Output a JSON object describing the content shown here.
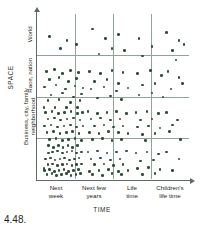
{
  "caption": "4.48.",
  "axes": {
    "y_title": "SPACE",
    "x_title": "TIME",
    "y_bands": [
      {
        "label": "neighborhood"
      },
      {
        "label": "Business, city, family"
      },
      {
        "label": "Race, nation"
      },
      {
        "label": "World"
      }
    ],
    "x_ticks": [
      {
        "line1": "Next",
        "line2": "week"
      },
      {
        "line1": "Next few",
        "line2": "years"
      },
      {
        "line1": "Life",
        "line2": "time"
      },
      {
        "line1": "Children's",
        "line2": "life time"
      }
    ]
  },
  "colors": {
    "dot": "#2f4f3a",
    "gridline": "#8fa398",
    "axis": "#5d6b63",
    "text": "#231f20",
    "background": "#ffffff"
  },
  "chart_data": {
    "type": "scatter",
    "title": "",
    "subtitle": "",
    "xlabel": "TIME",
    "ylabel": "SPACE",
    "grid": true,
    "legend": "none",
    "x_categories": [
      "Next week",
      "Next few years",
      "Life time",
      "Children's life time"
    ],
    "y_categories": [
      "neighborhood",
      "Business, city, family",
      "Race, nation",
      "World"
    ],
    "xlim": [
      0,
      4
    ],
    "ylim": [
      0,
      4
    ],
    "cell_counts": [
      {
        "x": "Next week",
        "y": "neighborhood",
        "count": 48
      },
      {
        "x": "Next few years",
        "y": "neighborhood",
        "count": 22
      },
      {
        "x": "Life time",
        "y": "neighborhood",
        "count": 7
      },
      {
        "x": "Children's life time",
        "y": "neighborhood",
        "count": 3
      },
      {
        "x": "Next week",
        "y": "Business, city, family",
        "count": 40
      },
      {
        "x": "Next few years",
        "y": "Business, city, family",
        "count": 21
      },
      {
        "x": "Life time",
        "y": "Business, city, family",
        "count": 14
      },
      {
        "x": "Children's life time",
        "y": "Business, city, family",
        "count": 5
      },
      {
        "x": "Next week",
        "y": "Race, nation",
        "count": 22
      },
      {
        "x": "Next few years",
        "y": "Race, nation",
        "count": 14
      },
      {
        "x": "Life time",
        "y": "Race, nation",
        "count": 8
      },
      {
        "x": "Children's life time",
        "y": "Race, nation",
        "count": 4
      },
      {
        "x": "Next week",
        "y": "World",
        "count": 4
      },
      {
        "x": "Next few years",
        "y": "World",
        "count": 6
      },
      {
        "x": "Life time",
        "y": "World",
        "count": 3
      },
      {
        "x": "Children's life time",
        "y": "World",
        "count": 5
      }
    ],
    "points": [
      [
        13,
        142
      ],
      [
        18,
        141
      ],
      [
        24,
        140
      ],
      [
        30,
        142
      ],
      [
        36,
        141
      ],
      [
        42,
        140
      ],
      [
        48,
        142
      ],
      [
        54,
        141
      ],
      [
        9,
        148
      ],
      [
        15,
        147
      ],
      [
        21,
        149
      ],
      [
        27,
        148
      ],
      [
        33,
        147
      ],
      [
        39,
        149
      ],
      [
        45,
        148
      ],
      [
        51,
        147
      ],
      [
        12,
        154
      ],
      [
        18,
        153
      ],
      [
        24,
        155
      ],
      [
        30,
        154
      ],
      [
        36,
        153
      ],
      [
        42,
        155
      ],
      [
        48,
        154
      ],
      [
        54,
        153
      ],
      [
        8,
        160
      ],
      [
        14,
        159
      ],
      [
        20,
        161
      ],
      [
        26,
        160
      ],
      [
        32,
        159
      ],
      [
        38,
        161
      ],
      [
        44,
        160
      ],
      [
        50,
        159
      ],
      [
        11,
        164
      ],
      [
        17,
        163
      ],
      [
        23,
        165
      ],
      [
        29,
        164
      ],
      [
        35,
        163
      ],
      [
        41,
        165
      ],
      [
        47,
        164
      ],
      [
        53,
        163
      ],
      [
        7,
        158
      ],
      [
        13,
        134
      ],
      [
        25,
        134
      ],
      [
        37,
        134
      ],
      [
        49,
        134
      ],
      [
        19,
        136
      ],
      [
        31,
        136
      ],
      [
        43,
        136
      ],
      [
        62,
        141
      ],
      [
        74,
        140
      ],
      [
        86,
        142
      ],
      [
        98,
        141
      ],
      [
        110,
        140
      ],
      [
        66,
        148
      ],
      [
        78,
        147
      ],
      [
        90,
        149
      ],
      [
        102,
        148
      ],
      [
        70,
        154
      ],
      [
        82,
        153
      ],
      [
        94,
        155
      ],
      [
        106,
        154
      ],
      [
        64,
        161
      ],
      [
        76,
        160
      ],
      [
        88,
        159
      ],
      [
        100,
        161
      ],
      [
        112,
        160
      ],
      [
        68,
        164
      ],
      [
        80,
        165
      ],
      [
        92,
        163
      ],
      [
        104,
        164
      ],
      [
        122,
        142
      ],
      [
        136,
        141
      ],
      [
        150,
        143
      ],
      [
        128,
        150
      ],
      [
        144,
        149
      ],
      [
        124,
        158
      ],
      [
        138,
        157
      ],
      [
        152,
        159
      ],
      [
        130,
        164
      ],
      [
        146,
        163
      ],
      [
        160,
        141
      ],
      [
        176,
        148
      ],
      [
        168,
        160
      ],
      [
        9,
        100
      ],
      [
        17,
        99
      ],
      [
        25,
        101
      ],
      [
        33,
        100
      ],
      [
        41,
        99
      ],
      [
        49,
        101
      ],
      [
        55,
        100
      ],
      [
        12,
        107
      ],
      [
        20,
        106
      ],
      [
        28,
        108
      ],
      [
        36,
        107
      ],
      [
        44,
        106
      ],
      [
        52,
        108
      ],
      [
        8,
        114
      ],
      [
        16,
        113
      ],
      [
        24,
        115
      ],
      [
        32,
        114
      ],
      [
        40,
        113
      ],
      [
        48,
        115
      ],
      [
        56,
        114
      ],
      [
        11,
        121
      ],
      [
        19,
        120
      ],
      [
        27,
        122
      ],
      [
        35,
        121
      ],
      [
        43,
        120
      ],
      [
        51,
        122
      ],
      [
        14,
        128
      ],
      [
        22,
        127
      ],
      [
        30,
        129
      ],
      [
        38,
        128
      ],
      [
        46,
        127
      ],
      [
        54,
        129
      ],
      [
        7,
        95
      ],
      [
        21,
        95
      ],
      [
        35,
        95
      ],
      [
        49,
        95
      ],
      [
        62,
        99
      ],
      [
        74,
        101
      ],
      [
        86,
        100
      ],
      [
        98,
        99
      ],
      [
        110,
        101
      ],
      [
        66,
        107
      ],
      [
        78,
        106
      ],
      [
        90,
        108
      ],
      [
        102,
        107
      ],
      [
        70,
        114
      ],
      [
        82,
        113
      ],
      [
        94,
        115
      ],
      [
        106,
        114
      ],
      [
        64,
        121
      ],
      [
        76,
        122
      ],
      [
        88,
        120
      ],
      [
        100,
        121
      ],
      [
        112,
        122
      ],
      [
        68,
        128
      ],
      [
        80,
        127
      ],
      [
        92,
        129
      ],
      [
        104,
        128
      ],
      [
        122,
        100
      ],
      [
        136,
        99
      ],
      [
        150,
        101
      ],
      [
        128,
        108
      ],
      [
        142,
        107
      ],
      [
        124,
        115
      ],
      [
        138,
        114
      ],
      [
        152,
        116
      ],
      [
        130,
        123
      ],
      [
        146,
        122
      ],
      [
        134,
        129
      ],
      [
        160,
        100
      ],
      [
        174,
        108
      ],
      [
        164,
        120
      ],
      [
        178,
        128
      ],
      [
        168,
        113
      ],
      [
        10,
        58
      ],
      [
        20,
        56
      ],
      [
        30,
        60
      ],
      [
        40,
        57
      ],
      [
        50,
        59
      ],
      [
        14,
        66
      ],
      [
        26,
        64
      ],
      [
        38,
        68
      ],
      [
        48,
        65
      ],
      [
        8,
        74
      ],
      [
        22,
        72
      ],
      [
        34,
        76
      ],
      [
        46,
        73
      ],
      [
        56,
        75
      ],
      [
        16,
        82
      ],
      [
        30,
        80
      ],
      [
        44,
        84
      ],
      [
        54,
        81
      ],
      [
        12,
        88
      ],
      [
        26,
        87
      ],
      [
        40,
        90
      ],
      [
        52,
        88
      ],
      [
        64,
        58
      ],
      [
        78,
        60
      ],
      [
        92,
        57
      ],
      [
        106,
        59
      ],
      [
        70,
        68
      ],
      [
        86,
        66
      ],
      [
        100,
        70
      ],
      [
        66,
        76
      ],
      [
        82,
        74
      ],
      [
        98,
        78
      ],
      [
        112,
        75
      ],
      [
        74,
        85
      ],
      [
        90,
        83
      ],
      [
        104,
        87
      ],
      [
        124,
        60
      ],
      [
        140,
        57
      ],
      [
        154,
        62
      ],
      [
        130,
        72
      ],
      [
        146,
        70
      ],
      [
        126,
        82
      ],
      [
        142,
        80
      ],
      [
        156,
        84
      ],
      [
        162,
        58
      ],
      [
        176,
        64
      ],
      [
        166,
        76
      ],
      [
        180,
        70
      ],
      [
        14,
        22
      ],
      [
        36,
        26
      ],
      [
        28,
        34
      ],
      [
        48,
        30
      ],
      [
        68,
        14
      ],
      [
        84,
        24
      ],
      [
        100,
        20
      ],
      [
        92,
        34
      ],
      [
        76,
        40
      ],
      [
        108,
        36
      ],
      [
        126,
        24
      ],
      [
        142,
        32
      ],
      [
        130,
        42
      ],
      [
        160,
        18
      ],
      [
        176,
        26
      ],
      [
        168,
        36
      ],
      [
        182,
        30
      ],
      [
        172,
        46
      ]
    ]
  }
}
